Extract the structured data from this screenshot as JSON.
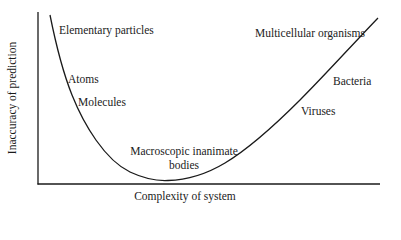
{
  "diagram": {
    "axes": {
      "x_label": "Complexity of system",
      "y_label": "Inaccuracy of prediction"
    },
    "curve_labels": [
      {
        "id": "elementary-particles",
        "text": "Elementary particles"
      },
      {
        "id": "atoms",
        "text": "Atoms"
      },
      {
        "id": "molecules",
        "text": "Molecules"
      },
      {
        "id": "macroscopic-line1",
        "text": "Macroscopic inanimate"
      },
      {
        "id": "macroscopic-line2",
        "text": "bodies"
      },
      {
        "id": "viruses",
        "text": "Viruses"
      },
      {
        "id": "bacteria",
        "text": "Bacteria"
      },
      {
        "id": "multicellular-organisms",
        "text": "Multicellular organisms"
      }
    ],
    "colors": {
      "line": "#1a1a1a",
      "background": "#ffffff"
    }
  }
}
